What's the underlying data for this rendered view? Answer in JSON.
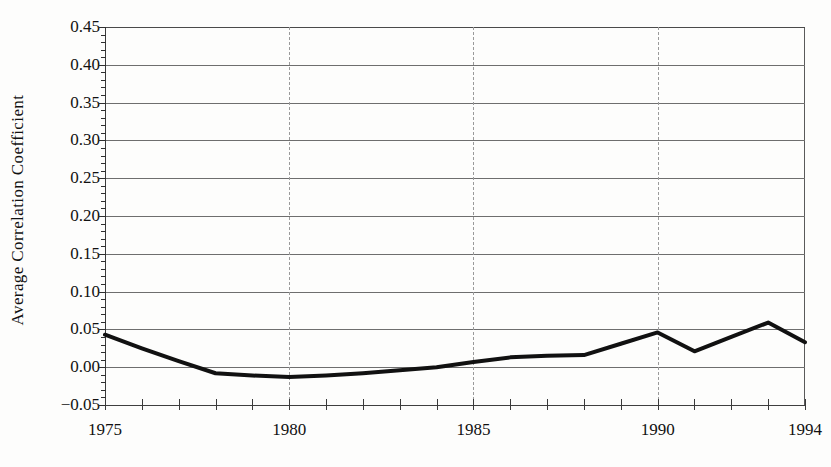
{
  "chart_data": {
    "type": "line",
    "title": "",
    "xlabel": "",
    "ylabel": "Average Correlation Coefficient",
    "xlim": [
      1975,
      1994
    ],
    "ylim": [
      -0.05,
      0.45
    ],
    "grid": "horizontal major gridlines every 0.05; dashed vertical gridlines at 1980, 1985, 1990",
    "legend": "none",
    "y_tick_labels": [
      "0.45",
      "0.40",
      "0.35",
      "0.30",
      "0.25",
      "0.20",
      "0.15",
      "0.10",
      "0.05",
      "0.00",
      "−0.05"
    ],
    "y_tick_values": [
      0.45,
      0.4,
      0.35,
      0.3,
      0.25,
      0.2,
      0.15,
      0.1,
      0.05,
      0.0,
      -0.05
    ],
    "y_minor_tick_interval": 0.01,
    "x_tick_labels": [
      "1975",
      "1980",
      "1985",
      "1990",
      "1994"
    ],
    "x_labeled_values": [
      1975,
      1980,
      1985,
      1990,
      1994
    ],
    "x_tick_values": [
      1975,
      1976,
      1977,
      1978,
      1979,
      1980,
      1981,
      1982,
      1983,
      1984,
      1985,
      1986,
      1987,
      1988,
      1989,
      1990,
      1991,
      1992,
      1993,
      1994
    ],
    "vertical_gridline_values": [
      1980,
      1985,
      1990
    ],
    "x": [
      1975,
      1976,
      1977,
      1978,
      1979,
      1980,
      1981,
      1982,
      1983,
      1984,
      1985,
      1986,
      1987,
      1988,
      1989,
      1990,
      1991,
      1992,
      1993,
      1994
    ],
    "values": [
      0.043,
      0.025,
      0.008,
      -0.008,
      -0.011,
      -0.013,
      -0.011,
      -0.008,
      -0.004,
      0.0,
      0.007,
      0.013,
      0.015,
      0.016,
      0.031,
      0.046,
      0.021,
      0.04,
      0.059,
      0.033
    ],
    "series": [
      {
        "name": "Average Correlation Coefficient",
        "values": [
          0.043,
          0.025,
          0.008,
          -0.008,
          -0.011,
          -0.013,
          -0.011,
          -0.008,
          -0.004,
          0.0,
          0.007,
          0.013,
          0.015,
          0.016,
          0.031,
          0.046,
          0.021,
          0.04,
          0.059,
          0.033
        ],
        "color": "#111111",
        "line_width": 4
      }
    ],
    "colors": {
      "line": "#111111",
      "grid": "#6e6e6e",
      "vertical_grid": "#9a9a9a",
      "axis": "#2f2f2f",
      "background": "#fdfdfc",
      "text": "#111111"
    }
  }
}
